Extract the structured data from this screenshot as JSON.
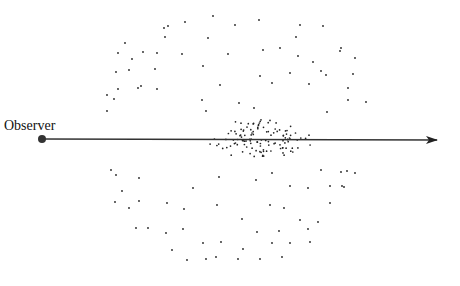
{
  "observer_label": "Observer",
  "colors": {
    "ink": "#222222"
  },
  "observer": {
    "x": 42,
    "y": 139,
    "r": 4
  },
  "sightline": {
    "x1": 42,
    "y1": 139,
    "x2": 437,
    "y2": 140
  },
  "dots": [
    [
      213,
      16
    ],
    [
      185,
      22
    ],
    [
      259,
      20
    ],
    [
      300,
      25
    ],
    [
      168,
      26
    ],
    [
      235,
      25
    ],
    [
      323,
      26
    ],
    [
      125,
      43
    ],
    [
      165,
      37
    ],
    [
      280,
      48
    ],
    [
      208,
      38
    ],
    [
      164,
      28
    ],
    [
      296,
      37
    ],
    [
      341,
      48
    ],
    [
      298,
      56
    ],
    [
      118,
      53
    ],
    [
      143,
      52
    ],
    [
      157,
      53
    ],
    [
      340,
      51
    ],
    [
      182,
      54
    ],
    [
      228,
      54
    ],
    [
      263,
      50
    ],
    [
      326,
      75
    ],
    [
      313,
      62
    ],
    [
      132,
      59
    ],
    [
      355,
      58
    ],
    [
      116,
      72
    ],
    [
      129,
      70
    ],
    [
      155,
      69
    ],
    [
      203,
      66
    ],
    [
      321,
      71
    ],
    [
      260,
      76
    ],
    [
      309,
      84
    ],
    [
      141,
      86
    ],
    [
      220,
      85
    ],
    [
      272,
      83
    ],
    [
      353,
      74
    ],
    [
      348,
      88
    ],
    [
      107,
      95
    ],
    [
      114,
      99
    ],
    [
      118,
      89
    ],
    [
      138,
      88
    ],
    [
      157,
      89
    ],
    [
      202,
      100
    ],
    [
      239,
      103
    ],
    [
      254,
      108
    ],
    [
      348,
      100
    ],
    [
      366,
      102
    ],
    [
      107,
      111
    ],
    [
      206,
      111
    ],
    [
      327,
      112
    ],
    [
      290,
      73
    ],
    [
      111,
      170
    ],
    [
      116,
      175
    ],
    [
      139,
      178
    ],
    [
      219,
      177
    ],
    [
      272,
      173
    ],
    [
      321,
      170
    ],
    [
      355,
      173
    ],
    [
      347,
      171
    ],
    [
      341,
      172
    ],
    [
      122,
      191
    ],
    [
      193,
      188
    ],
    [
      256,
      180
    ],
    [
      290,
      186
    ],
    [
      308,
      188
    ],
    [
      344,
      187
    ],
    [
      330,
      186
    ],
    [
      342,
      186
    ],
    [
      115,
      202
    ],
    [
      139,
      201
    ],
    [
      167,
      203
    ],
    [
      217,
      205
    ],
    [
      270,
      205
    ],
    [
      284,
      208
    ],
    [
      330,
      203
    ],
    [
      129,
      208
    ],
    [
      184,
      209
    ],
    [
      242,
      219
    ],
    [
      300,
      220
    ],
    [
      318,
      222
    ],
    [
      136,
      228
    ],
    [
      148,
      228
    ],
    [
      166,
      233
    ],
    [
      183,
      229
    ],
    [
      257,
      232
    ],
    [
      279,
      231
    ],
    [
      308,
      229
    ],
    [
      203,
      243
    ],
    [
      221,
      242
    ],
    [
      243,
      249
    ],
    [
      272,
      243
    ],
    [
      290,
      243
    ],
    [
      310,
      242
    ],
    [
      172,
      250
    ],
    [
      187,
      260
    ],
    [
      206,
      259
    ],
    [
      216,
      257
    ],
    [
      238,
      259
    ],
    [
      260,
      259
    ],
    [
      282,
      257
    ]
  ],
  "cluster": {
    "cx": 260,
    "cy": 139,
    "count": 120,
    "rx": 55,
    "ry": 20
  }
}
